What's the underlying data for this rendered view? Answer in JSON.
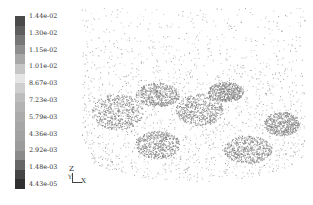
{
  "chart_data": {
    "type": "scatter",
    "title": "",
    "colorbar": {
      "position": "left",
      "orientation": "vertical",
      "min": 4.43e-05,
      "max": 0.0144,
      "tick_labels": [
        "1.44e-02",
        "1.30e-02",
        "1.15e-02",
        "1.01e-02",
        "8.67e-03",
        "7.23e-03",
        "5.79e-03",
        "4.36e-03",
        "2.92e-03",
        "1.48e-03",
        "4.43e-05"
      ],
      "tick_values": [
        0.0144,
        0.013,
        0.0115,
        0.0101,
        0.00867,
        0.00723,
        0.00579,
        0.00436,
        0.00292,
        0.00148,
        4.43e-05
      ],
      "colors_top_to_bottom": [
        "#4a4a4a",
        "#5e5e5e",
        "#767676",
        "#8e8e8e",
        "#a8a8a8",
        "#c6c6c6",
        "#e6e6e6",
        "#cfcfcf",
        "#bdbdbd",
        "#b3b3b3",
        "#ababab",
        "#a6a6a6",
        "#a2a2a2",
        "#9c9c9c",
        "#8a8a8a",
        "#666666",
        "#454545",
        "#303030"
      ]
    },
    "axes_triad": {
      "labels": [
        "Z",
        "Y",
        "X"
      ]
    },
    "clusters": [
      {
        "cx": 118,
        "cy": 112,
        "rx": 26,
        "ry": 18
      },
      {
        "cx": 158,
        "cy": 95,
        "rx": 22,
        "ry": 12
      },
      {
        "cx": 158,
        "cy": 145,
        "rx": 22,
        "ry": 14
      },
      {
        "cx": 200,
        "cy": 110,
        "rx": 24,
        "ry": 16
      },
      {
        "cx": 226,
        "cy": 92,
        "rx": 18,
        "ry": 10
      },
      {
        "cx": 248,
        "cy": 150,
        "rx": 24,
        "ry": 14
      },
      {
        "cx": 282,
        "cy": 124,
        "rx": 18,
        "ry": 12
      }
    ],
    "plot_extent": {
      "x": [
        82,
        305
      ],
      "y": [
        8,
        182
      ]
    }
  }
}
